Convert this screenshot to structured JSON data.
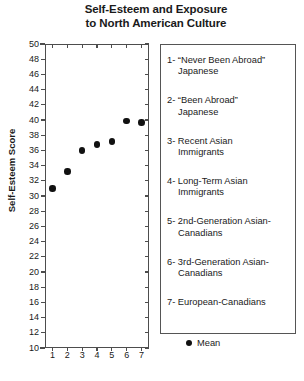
{
  "chart_data": {
    "type": "scatter",
    "title": "Self-Esteem and Exposure to North American Culture",
    "title_lines": [
      "Self-Esteem and Exposure",
      "to North American Culture"
    ],
    "xlabel": "",
    "ylabel": "Self-Esteem Score",
    "x": [
      1,
      2,
      3,
      4,
      5,
      6,
      7
    ],
    "values": [
      31.0,
      33.2,
      36.0,
      36.8,
      37.2,
      39.9,
      39.7
    ],
    "series": [
      {
        "name": "Mean",
        "values": [
          31.0,
          33.2,
          36.0,
          36.8,
          37.2,
          39.9,
          39.7
        ]
      }
    ],
    "xlim": [
      0.5,
      7.5
    ],
    "ylim": [
      10,
      50
    ],
    "ytick_step": 2,
    "ytick_labels": [
      "50",
      "48",
      "46",
      "44",
      "42",
      "40",
      "38",
      "36",
      "34",
      "32",
      "30",
      "28",
      "26",
      "24",
      "22",
      "20",
      "18",
      "16",
      "14",
      "12",
      "10"
    ],
    "xtick_labels": [
      "1",
      "2",
      "3",
      "4",
      "5",
      "6",
      "7"
    ],
    "grid": false,
    "legend_position": "right",
    "marker_color": "#111111",
    "axis_color": "#4d4d4d"
  },
  "legend": {
    "items": [
      {
        "number": "1-",
        "line1": "“Never Been Abroad”",
        "line2": "Japanese"
      },
      {
        "number": "2-",
        "line1": "“Been Abroad”",
        "line2": "Japanese"
      },
      {
        "number": "3-",
        "line1": "Recent Asian",
        "line2": "Immigrants"
      },
      {
        "number": "4-",
        "line1": "Long-Term Asian",
        "line2": "Immigrants"
      },
      {
        "number": "5-",
        "line1": "2nd-Generation Asian-",
        "line2": "Canadians"
      },
      {
        "number": "6-",
        "line1": "3rd-Generation Asian-",
        "line2": "Canadians"
      },
      {
        "number": "7-",
        "line1": "European-Canadians",
        "line2": ""
      }
    ],
    "mean_label": "Mean"
  }
}
